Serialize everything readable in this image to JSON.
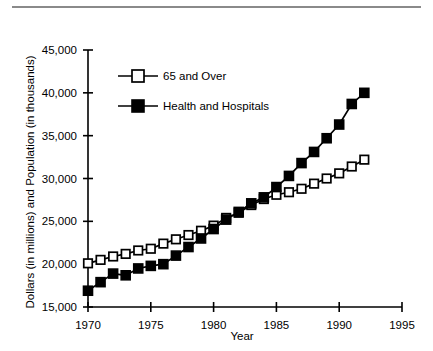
{
  "figure": {
    "top_rule": "horizontal-rule",
    "background_color": "#ffffff",
    "ink_color": "#000000"
  },
  "chart_data": {
    "type": "line",
    "title": "",
    "subtitle": "",
    "xlabel": "Year",
    "ylabel": "Dollars (in millions) and Population (in thousands)",
    "xlim": [
      1970,
      1995
    ],
    "ylim": [
      15000,
      45000
    ],
    "xticks": [
      1970,
      1975,
      1980,
      1985,
      1990,
      1995
    ],
    "xtick_labels": [
      "1970",
      "1975",
      "1980",
      "1985",
      "1990",
      "1995"
    ],
    "yticks": [
      15000,
      20000,
      25000,
      30000,
      35000,
      40000,
      45000
    ],
    "ytick_labels": [
      "15,000",
      "20,000",
      "25,000",
      "30,000",
      "35,000",
      "40,000",
      "45,000"
    ],
    "grid": false,
    "legend_position": "upper-left-inside",
    "x": [
      1970,
      1971,
      1972,
      1973,
      1974,
      1975,
      1976,
      1977,
      1978,
      1979,
      1980,
      1981,
      1982,
      1983,
      1984,
      1985,
      1986,
      1987,
      1988,
      1989,
      1990,
      1991,
      1992
    ],
    "series": [
      {
        "name": "65 and Over",
        "marker": "open-square",
        "line_color": "#000000",
        "marker_fill": "#ffffff",
        "values": [
          20100,
          20500,
          20900,
          21200,
          21600,
          21800,
          22400,
          22900,
          23400,
          23900,
          24500,
          25400,
          26000,
          26900,
          27600,
          28100,
          28400,
          28800,
          29400,
          30000,
          30600,
          31400,
          32200
        ]
      },
      {
        "name": "Health and Hospitals",
        "marker": "filled-square",
        "line_color": "#000000",
        "marker_fill": "#000000",
        "values": [
          16900,
          17900,
          18900,
          18700,
          19500,
          19800,
          20000,
          21000,
          22000,
          23000,
          24100,
          25200,
          26100,
          27100,
          27800,
          29000,
          30300,
          31800,
          33100,
          34700,
          36300,
          38700,
          40000
        ]
      }
    ],
    "annotations": []
  },
  "legend": {
    "entries": [
      {
        "label": "65 and Over",
        "marker": "open-square"
      },
      {
        "label": "Health and Hospitals",
        "marker": "filled-square"
      }
    ]
  }
}
